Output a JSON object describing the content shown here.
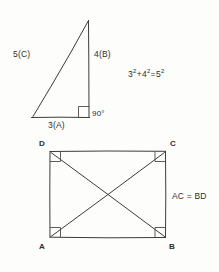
{
  "figure": {
    "title_absent": true,
    "background_color": "#fdfdfc",
    "ink_color": "#3c3b39"
  },
  "triangle": {
    "name": "right-triangle-3-4-5",
    "hypotenuse_label": "5(C)",
    "vertical_leg_label": "4(B)",
    "base_label": "3(A)",
    "right_angle_label": "90°",
    "right_angle_marker": "square-corner-mark"
  },
  "equation": {
    "full": "3²+4²=5²",
    "term_a_base": "3",
    "term_a_exp": "2",
    "plus": "+",
    "term_b_base": "4",
    "term_b_exp": "2",
    "equals": "=",
    "term_c_base": "5",
    "term_c_exp": "2"
  },
  "square": {
    "name": "square-with-diagonals",
    "vertex_top_left": "D",
    "vertex_top_right": "C",
    "vertex_bottom_left": "A",
    "vertex_bottom_right": "B",
    "diagonal_relation": "AC = BD",
    "corner_marks": 4,
    "diagonals": 2
  }
}
